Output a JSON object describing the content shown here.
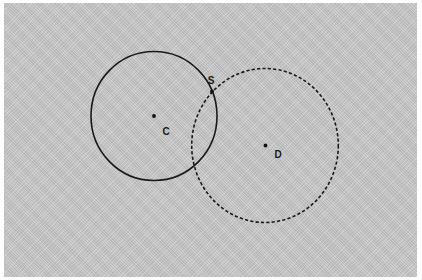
{
  "diagram": {
    "background_color": "#c9c9c9",
    "stroke_color": "#1a1a1a",
    "circles": [
      {
        "name": "circle-C",
        "style": "solid",
        "center": {
          "label": "C",
          "x": 154,
          "y": 116
        },
        "rx": 63,
        "ry": 64.5
      },
      {
        "name": "circle-D",
        "style": "dashed",
        "center": {
          "label": "D",
          "x": 265,
          "y": 145.5
        },
        "rx": 73.3,
        "ry": 77
      }
    ],
    "points": [
      {
        "label": "C",
        "x": 154,
        "y": 116,
        "label_x": 166,
        "label_y": 135
      },
      {
        "label": "D",
        "x": 265.5,
        "y": 145.5,
        "label_x": 278,
        "label_y": 158
      },
      {
        "label": "S",
        "x": 212,
        "y": 91.5,
        "label_x": 211,
        "label_y": 84
      }
    ]
  }
}
